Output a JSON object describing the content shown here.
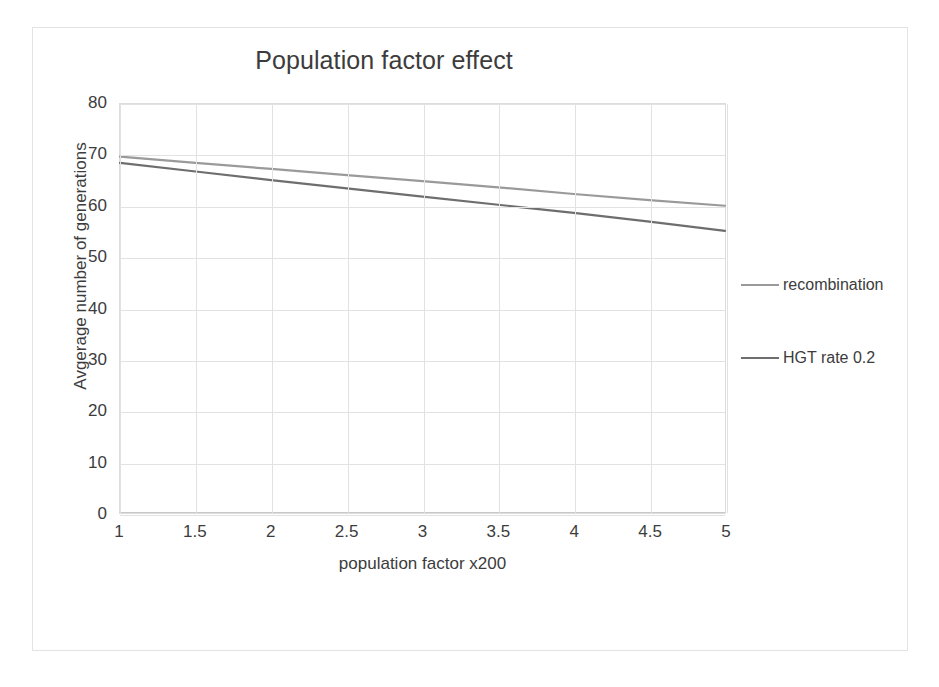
{
  "chart_data": {
    "type": "line",
    "title": "Population factor effect",
    "xlabel": "population factor x200",
    "ylabel": "Avgerage number of generations",
    "xlim": [
      1,
      5
    ],
    "ylim": [
      0,
      80
    ],
    "grid": true,
    "legend_position": "right",
    "x_ticks": [
      "1",
      "1.5",
      "2",
      "2.5",
      "3",
      "3.5",
      "4",
      "4.5",
      "5"
    ],
    "y_ticks": [
      "0",
      "10",
      "20",
      "30",
      "40",
      "50",
      "60",
      "70",
      "80"
    ],
    "x": [
      1,
      1.5,
      2,
      2.5,
      3,
      3.5,
      4,
      4.5,
      5
    ],
    "series": [
      {
        "name": "recombination",
        "color": "#9a9a9a",
        "values": [
          69.7,
          68.5,
          67.3,
          66.1,
          64.9,
          63.7,
          62.4,
          61.2,
          60.1
        ]
      },
      {
        "name": "HGT rate 0.2",
        "color": "#6e6e6e",
        "values": [
          68.5,
          66.8,
          65.1,
          63.5,
          61.9,
          60.3,
          58.7,
          57.0,
          55.2
        ]
      }
    ]
  },
  "chart": {
    "title": "Population factor effect",
    "x_axis_title": "population factor x200",
    "y_axis_title": "Avgerage number of generations",
    "y_ticks": [
      "80",
      "70",
      "60",
      "50",
      "40",
      "30",
      "20",
      "10",
      "0"
    ],
    "x_ticks": [
      "1",
      "1.5",
      "2",
      "2.5",
      "3",
      "3.5",
      "4",
      "4.5",
      "5"
    ],
    "legend": [
      {
        "label": "recombination",
        "color": "#9a9a9a"
      },
      {
        "label": "HGT rate 0.2",
        "color": "#6e6e6e"
      }
    ]
  }
}
